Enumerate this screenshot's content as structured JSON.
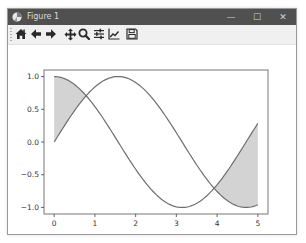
{
  "window": {
    "title": "Figure 1",
    "controls": {
      "minimize": "—",
      "maximize": "☐",
      "close": "✕"
    }
  },
  "toolbar": {
    "buttons": [
      {
        "name": "home",
        "icon": "home-icon",
        "tooltip": "Reset original view"
      },
      {
        "name": "back",
        "icon": "arrow-left-icon",
        "tooltip": "Back to previous view"
      },
      {
        "name": "forward",
        "icon": "arrow-right-icon",
        "tooltip": "Forward to next view"
      },
      {
        "name": "pan",
        "icon": "move-icon",
        "tooltip": "Pan axes"
      },
      {
        "name": "zoom",
        "icon": "magnifier-icon",
        "tooltip": "Zoom to rectangle"
      },
      {
        "name": "subplots",
        "icon": "sliders-icon",
        "tooltip": "Configure subplots"
      },
      {
        "name": "edit",
        "icon": "line-chart-icon",
        "tooltip": "Edit axis, curve and image parameters"
      },
      {
        "name": "save",
        "icon": "floppy-disk-icon",
        "tooltip": "Save the figure"
      }
    ]
  },
  "colors": {
    "titlebar": "#505050",
    "curve": "#6e6e6e",
    "fill": "#d3d3d3",
    "axes": "#777777"
  },
  "chart_data": {
    "type": "line",
    "title": "",
    "xlabel": "",
    "ylabel": "",
    "xlim": [
      -0.25,
      5.25
    ],
    "ylim": [
      -1.1,
      1.1
    ],
    "xticks": [
      "0",
      "1",
      "2",
      "3",
      "4",
      "5"
    ],
    "yticks": [
      "1.0",
      "0.5",
      "0.0",
      "−0.5",
      "−1.0"
    ],
    "grid": false,
    "legend": null,
    "series": [
      {
        "name": "sin(x)",
        "function": "sin",
        "x_range": [
          0,
          5
        ],
        "x": [
          0,
          0.5,
          1,
          1.5,
          2,
          2.5,
          3,
          3.5,
          4,
          4.5,
          5
        ],
        "y": [
          0.0,
          0.48,
          0.84,
          1.0,
          0.91,
          0.6,
          0.14,
          -0.35,
          -0.76,
          -0.98,
          -0.96
        ]
      },
      {
        "name": "cos(x)",
        "function": "cos",
        "x_range": [
          0,
          5
        ],
        "x": [
          0,
          0.5,
          1,
          1.5,
          2,
          2.5,
          3,
          3.5,
          4,
          4.5,
          5
        ],
        "y": [
          1.0,
          0.88,
          0.54,
          0.07,
          -0.42,
          -0.8,
          -0.99,
          -0.94,
          -0.65,
          -0.21,
          0.28
        ]
      }
    ],
    "fill_between": {
      "description": "shaded region between sin(x) and cos(x) where cos(x) > sin(x)",
      "regions": [
        [
          0,
          0.785
        ],
        [
          3.927,
          5
        ]
      ],
      "color": "#d3d3d3"
    }
  }
}
